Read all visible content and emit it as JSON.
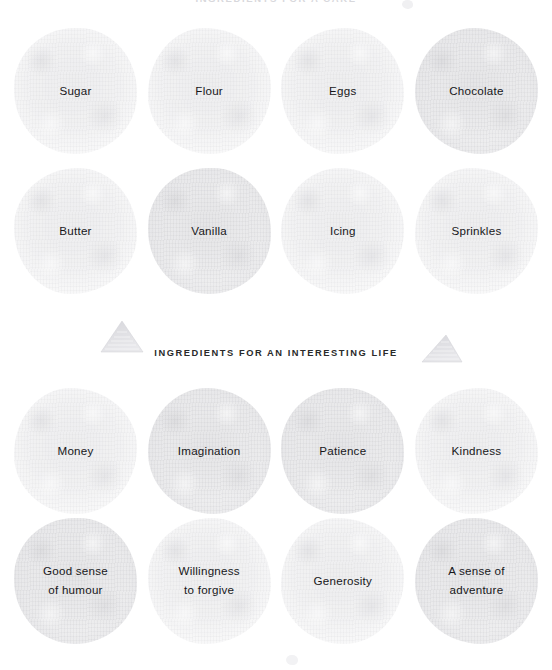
{
  "poster": {
    "background_color": "#ffffff",
    "top_heading": "INGREDIENTS FOR A CAKE",
    "section_heading": "INGREDIENTS FOR AN INTERESTING LIFE",
    "text_color": "#17171a",
    "blob_color": "#9a9aa2"
  },
  "sections": [
    {
      "name": "cake",
      "heading": "INGREDIENTS FOR A CAKE",
      "rows": [
        {
          "blobs": [
            {
              "label": "Sugar",
              "tone": "light"
            },
            {
              "label": "Flour",
              "tone": "light"
            },
            {
              "label": "Eggs",
              "tone": "light"
            },
            {
              "label": "Chocolate",
              "tone": "dark"
            }
          ]
        },
        {
          "blobs": [
            {
              "label": "Butter",
              "tone": "light"
            },
            {
              "label": "Vanilla",
              "tone": "dark"
            },
            {
              "label": "Icing",
              "tone": "light"
            },
            {
              "label": "Sprinkles",
              "tone": "light"
            }
          ]
        }
      ]
    },
    {
      "name": "life",
      "heading": "INGREDIENTS FOR AN INTERESTING LIFE",
      "rows": [
        {
          "blobs": [
            {
              "label": "Money",
              "tone": "light"
            },
            {
              "label": "Imagination",
              "tone": "dark"
            },
            {
              "label": "Patience",
              "tone": "dark"
            },
            {
              "label": "Kindness",
              "tone": "light"
            }
          ]
        },
        {
          "blobs": [
            {
              "label": "Good sense\nof humour",
              "tone": "dark"
            },
            {
              "label": "Willingness\nto forgive",
              "tone": "light"
            },
            {
              "label": "Generosity",
              "tone": "light"
            },
            {
              "label": "A sense of\nadventure",
              "tone": "dark"
            }
          ]
        }
      ]
    }
  ],
  "decorations": {
    "triangle_left": "pencil-triangle",
    "triangle_right": "pencil-triangle",
    "top_speck": "pencil-speck",
    "bottom_speck": "pencil-speck"
  }
}
